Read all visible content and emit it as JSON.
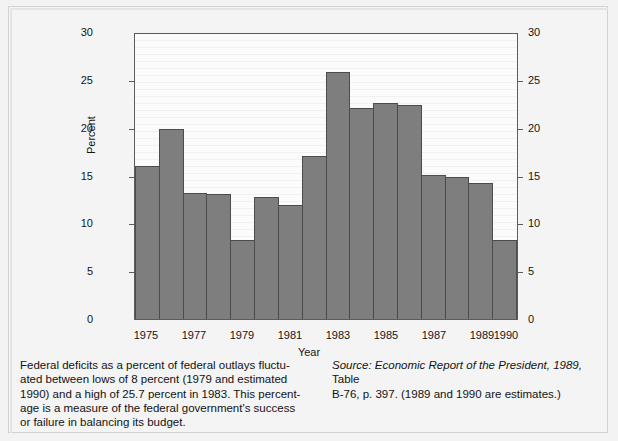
{
  "chart_data": {
    "type": "bar",
    "title": "",
    "xlabel": "Year",
    "ylabel": "Percent",
    "ylim": [
      0,
      30
    ],
    "yticks": [
      0,
      5,
      10,
      15,
      20,
      25,
      30
    ],
    "ytick_labels_left": [
      "30",
      "25",
      "20",
      "15",
      "10",
      "5",
      "0"
    ],
    "ytick_labels_right": [
      "30",
      "25",
      "20",
      "15",
      "10",
      "5",
      "0"
    ],
    "grid": false,
    "legend": "none",
    "bar_color": "#7e7e7e",
    "bar_edge_color": "#4c4c4c",
    "axis_color": "#5d5d5d",
    "plot_background": "#fbfbfb",
    "categories": [
      "1975",
      "1976",
      "1977",
      "1978",
      "1979",
      "1980",
      "1981",
      "1982",
      "1983",
      "1984",
      "1985",
      "1986",
      "1987",
      "1988",
      "1989",
      "1990"
    ],
    "values": [
      16.1,
      20.0,
      13.3,
      13.2,
      8.3,
      12.8,
      12.0,
      17.2,
      26.0,
      22.2,
      22.7,
      22.5,
      15.2,
      15.0,
      14.3,
      8.3
    ],
    "xtick_labels": [
      "1975",
      "1977",
      "1979",
      "1981",
      "1983",
      "1985",
      "1987",
      "1989",
      "1990"
    ],
    "xtick_categories": [
      "1975",
      "1977",
      "1979",
      "1981",
      "1983",
      "1985",
      "1987",
      "1989",
      "1990"
    ]
  },
  "caption": {
    "lines": [
      "Federal deficits as a percent of federal outlays fluctu-",
      "ated between lows of 8 percent (1979 and estimated",
      "1990) and a high of 25.7 percent in 1983. This percent-",
      "age is a measure of the federal government's success",
      "or failure in balancing its budget."
    ]
  },
  "source": {
    "label": "Source:",
    "italic_text": "Economic Report of the President, 1989,",
    "rest_line1": " Table",
    "line2": "B-76, p. 397. (1989 and 1990 are estimates.)"
  }
}
